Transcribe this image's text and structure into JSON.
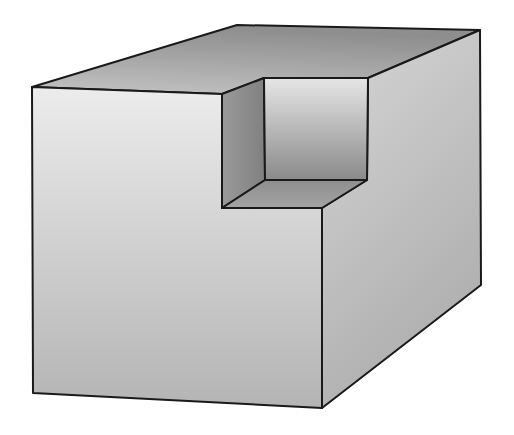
{
  "figure": {
    "colors": {
      "background": "#ffffff",
      "edge": "#1a1a1a",
      "front_top": "#ececec",
      "front_bottom": "#b4b4b4",
      "top_light": "#c4c4c4",
      "top_dark": "#8e8e8e",
      "right_light": "#d2d2d2",
      "right_dark": "#aeaeae",
      "notch_back_top": "#e6e6e6",
      "notch_back_bottom": "#8a8a8a",
      "notch_wall": "#8c8c8c",
      "notch_floor": "#9a9a9a"
    },
    "vertices": {
      "A": [
        32,
        87
      ],
      "B": [
        237,
        25
      ],
      "C": [
        480,
        30
      ],
      "D": [
        222,
        94
      ],
      "E": [
        264,
        78
      ],
      "F": [
        368,
        78
      ],
      "G": [
        222,
        208
      ],
      "H": [
        265,
        180
      ],
      "I": [
        367,
        180
      ],
      "J": [
        322,
        208
      ],
      "K": [
        33,
        393
      ],
      "L": [
        322,
        408
      ],
      "M": [
        481,
        285
      ]
    }
  }
}
